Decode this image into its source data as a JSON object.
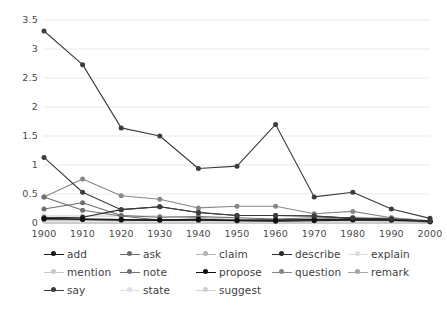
{
  "chart_data": {
    "type": "line",
    "title": "",
    "xlabel": "",
    "ylabel": "",
    "categories": [
      "1900",
      "1910",
      "1920",
      "1930",
      "1940",
      "1950",
      "1960",
      "1970",
      "1980",
      "1990",
      "2000"
    ],
    "x": [
      1900,
      1910,
      1920,
      1930,
      1940,
      1950,
      1960,
      1970,
      1980,
      1990,
      2000
    ],
    "ylim": [
      0,
      3.5
    ],
    "xlim": [
      1900,
      2000
    ],
    "yticks": [
      "0",
      "0.5",
      "1",
      "1.5",
      "2",
      "2.5",
      "3",
      "3.5"
    ],
    "ytick_values": [
      0,
      0.5,
      1,
      1.5,
      2,
      2.5,
      3,
      3.5
    ],
    "grid": true,
    "legend_position": "bottom",
    "series": [
      {
        "name": "add",
        "color": "#1a1a1a",
        "values": [
          0.08,
          0.06,
          0.05,
          0.05,
          0.07,
          0.04,
          0.03,
          0.04,
          0.05,
          0.05,
          0.03
        ]
      },
      {
        "name": "ask",
        "color": "#6e6e6e",
        "values": [
          0.24,
          0.35,
          0.13,
          0.1,
          0.11,
          0.09,
          0.07,
          0.09,
          0.09,
          0.06,
          0.03
        ]
      },
      {
        "name": "claim",
        "color": "#b4b4b4",
        "values": [
          0.05,
          0.05,
          0.04,
          0.05,
          0.05,
          0.05,
          0.05,
          0.07,
          0.1,
          0.09,
          0.04
        ]
      },
      {
        "name": "describe",
        "color": "#2b2b2b",
        "values": [
          0.09,
          0.1,
          0.23,
          0.28,
          0.18,
          0.13,
          0.13,
          0.12,
          0.08,
          0.07,
          0.03
        ]
      },
      {
        "name": "explain",
        "color": "#dcdcdc",
        "values": [
          0.03,
          0.03,
          0.03,
          0.03,
          0.03,
          0.03,
          0.03,
          0.04,
          0.05,
          0.04,
          0.02
        ]
      },
      {
        "name": "mention",
        "color": "#c8c8c8",
        "values": [
          0.12,
          0.12,
          0.12,
          0.12,
          0.09,
          0.06,
          0.05,
          0.06,
          0.06,
          0.05,
          0.02
        ]
      },
      {
        "name": "note",
        "color": "#707070",
        "values": [
          0.45,
          0.22,
          0.12,
          0.05,
          0.05,
          0.04,
          0.04,
          0.05,
          0.06,
          0.05,
          0.02
        ]
      },
      {
        "name": "propose",
        "color": "#111111",
        "values": [
          0.07,
          0.07,
          0.06,
          0.05,
          0.05,
          0.05,
          0.05,
          0.06,
          0.07,
          0.06,
          0.03
        ]
      },
      {
        "name": "question",
        "color": "#878787",
        "values": [
          0.45,
          0.76,
          0.47,
          0.41,
          0.26,
          0.29,
          0.29,
          0.16,
          0.2,
          0.09,
          0.04
        ]
      },
      {
        "name": "remark",
        "color": "#a5a5a5",
        "values": [
          0.07,
          0.07,
          0.06,
          0.05,
          0.05,
          0.05,
          0.05,
          0.05,
          0.05,
          0.04,
          0.02
        ]
      },
      {
        "name": "say",
        "color": "#3c3c3c",
        "values": [
          3.31,
          2.73,
          1.64,
          1.5,
          0.94,
          0.98,
          1.7,
          0.45,
          0.53,
          0.24,
          0.08
        ]
      },
      {
        "name": "state",
        "color": "#e0e0e0",
        "values": [
          0.08,
          0.06,
          0.05,
          0.04,
          0.04,
          0.02,
          0.02,
          0.03,
          0.03,
          0.03,
          0.01
        ]
      },
      {
        "name": "suggest",
        "color": "#cfcfcf",
        "values": [
          0.1,
          0.08,
          0.06,
          0.05,
          0.04,
          0.03,
          0.03,
          0.04,
          0.04,
          0.03,
          0.01
        ]
      }
    ],
    "extra_series_dark_mid": {
      "name": "say-secondary",
      "color": "#3c3c3c",
      "values": [
        1.13,
        0.53,
        0.23,
        0.28,
        0.18,
        0.13,
        0.13,
        0.12,
        0.08,
        0.07,
        0.03
      ]
    }
  },
  "legend": {
    "rows": [
      [
        {
          "label": "add",
          "color": "#1a1a1a"
        },
        {
          "label": "ask",
          "color": "#6e6e6e"
        },
        {
          "label": "claim",
          "color": "#b4b4b4"
        },
        {
          "label": "describe",
          "color": "#2b2b2b"
        },
        {
          "label": "explain",
          "color": "#dcdcdc"
        }
      ],
      [
        {
          "label": "mention",
          "color": "#c8c8c8"
        },
        {
          "label": "note",
          "color": "#707070"
        },
        {
          "label": "propose",
          "color": "#111111"
        },
        {
          "label": "question",
          "color": "#878787"
        },
        {
          "label": "remark",
          "color": "#a5a5a5"
        }
      ],
      [
        {
          "label": "say",
          "color": "#3c3c3c"
        },
        {
          "label": "state",
          "color": "#e0e0e0"
        },
        {
          "label": "suggest",
          "color": "#cfcfcf"
        }
      ]
    ]
  },
  "caption": {
    "text": ""
  },
  "colors": {
    "grid": "#e9e9e9",
    "axis": "#9a9a9a",
    "tick_text": "#4a4a4a",
    "background": "#ffffff"
  }
}
